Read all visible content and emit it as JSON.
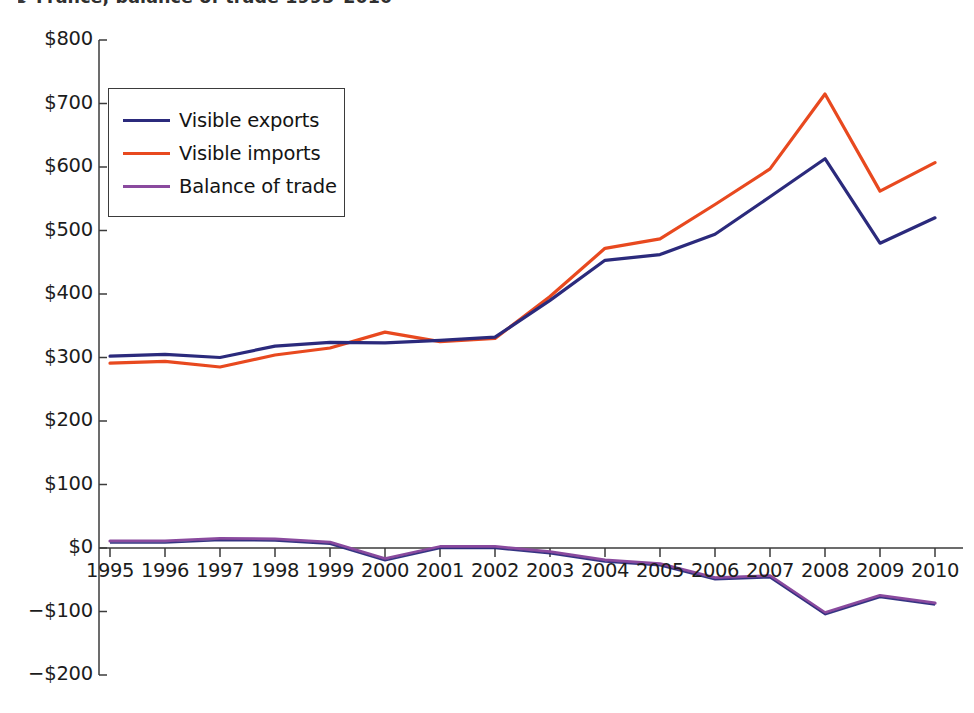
{
  "title": {
    "bullet": "▸",
    "text": "France, balance of trade 1995–2010"
  },
  "legend": {
    "position": "upper-left inside axes",
    "entries": [
      {
        "label": "Visible exports",
        "color": "#2b2a7c"
      },
      {
        "label": "Visible imports",
        "color": "#e8491f"
      },
      {
        "label": "Balance of trade",
        "color": "#8a4a9e"
      }
    ]
  },
  "axes": {
    "y_tick_labels": [
      "$800",
      "$700",
      "$600",
      "$500",
      "$400",
      "$300",
      "$200",
      "$100",
      "$0",
      "−$100",
      "−$200"
    ],
    "x_tick_labels": [
      "1995",
      "1996",
      "1997",
      "1998",
      "1999",
      "2000",
      "2001",
      "2002",
      "2003",
      "2004",
      "2005",
      "2006",
      "2007",
      "2008",
      "2009",
      "2010"
    ]
  },
  "chart_data": {
    "type": "line",
    "title": "France, balance of trade 1995–2010",
    "xlabel": "",
    "ylabel": "",
    "ylim": [
      -200,
      800
    ],
    "ytick_step": 100,
    "y_unit": "$ billions",
    "grid": false,
    "legend_position": "upper left",
    "x": [
      1995,
      1996,
      1997,
      1998,
      1999,
      2000,
      2001,
      2002,
      2003,
      2004,
      2005,
      2006,
      2007,
      2008,
      2009,
      2010
    ],
    "series": [
      {
        "name": "Visible exports",
        "color": "#2b2a7c",
        "values": [
          302,
          305,
          300,
          318,
          324,
          323,
          327,
          332,
          390,
          453,
          462,
          494,
          553,
          613,
          480,
          520
        ]
      },
      {
        "name": "Visible imports",
        "color": "#e8491f",
        "values": [
          291,
          294,
          285,
          304,
          315,
          340,
          325,
          330,
          396,
          472,
          487,
          541,
          597,
          715,
          562,
          607
        ]
      },
      {
        "name": "Balance of trade",
        "color": "#8a4a9e",
        "values": [
          11,
          11,
          15,
          14,
          9,
          -17,
          2,
          2,
          -6,
          -19,
          -25,
          -47,
          -44,
          -102,
          -75,
          -87
        ]
      }
    ]
  }
}
